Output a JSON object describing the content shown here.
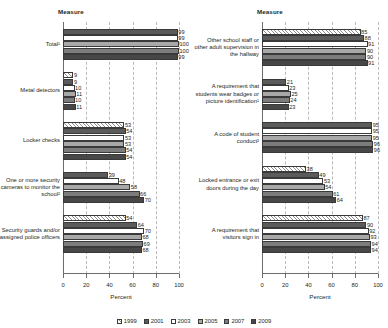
{
  "chart_data": {
    "type": "bar",
    "orientation": "horizontal",
    "title": "",
    "xlabel": "Percent",
    "ylabel": "Measure",
    "xlim": [
      0,
      100
    ],
    "xticks": [
      0,
      20,
      40,
      60,
      80,
      100
    ],
    "grid": true,
    "legend_position": "bottom",
    "series_names": [
      "1999",
      "2001",
      "2003",
      "2005",
      "2007",
      "2009"
    ],
    "panels": [
      {
        "name": "left",
        "axis_header": "Measure",
        "xlabel": "Percent",
        "groups": [
          {
            "category": "Total¹",
            "series": [
              "2001",
              "2003",
              "2005",
              "2007",
              "2009"
            ],
            "values": [
              99,
              99,
              100,
              100,
              99
            ]
          },
          {
            "category": "Metal detectors",
            "series": [
              "1999",
              "2001",
              "2003",
              "2005",
              "2007",
              "2009"
            ],
            "values": [
              9,
              9,
              10,
              11,
              10,
              11
            ]
          },
          {
            "category": "Locker checks",
            "series": [
              "1999",
              "2001",
              "2003",
              "2005",
              "2007",
              "2009"
            ],
            "values": [
              53,
              54,
              53,
              53,
              54,
              54
            ]
          },
          {
            "category": "One or more security cameras to monitor the school²",
            "series": [
              "2001",
              "2003",
              "2005",
              "2007",
              "2009"
            ],
            "values": [
              39,
              48,
              58,
              66,
              70
            ]
          },
          {
            "category": "Security guards and/or assigned police officers",
            "series": [
              "1999",
              "2001",
              "2003",
              "2005",
              "2007",
              "2009"
            ],
            "values": [
              54,
              64,
              70,
              68,
              69,
              68
            ]
          }
        ]
      },
      {
        "name": "right",
        "axis_header": "Measure",
        "xlabel": "Percent",
        "groups": [
          {
            "category": "Other school staff or other adult supervision in the hallway",
            "series": [
              "1999",
              "2001",
              "2003",
              "2005",
              "2007",
              "2009"
            ],
            "values": [
              85,
              88,
              91,
              90,
              90,
              91
            ]
          },
          {
            "category": "A requirement that students wear badges or picture identification¹",
            "series": [
              "2001",
              "2003",
              "2005",
              "2007",
              "2009"
            ],
            "values": [
              21,
              23,
              25,
              24,
              23
            ]
          },
          {
            "category": "A code of student conduct²",
            "series": [
              "2001",
              "2003",
              "2005",
              "2007",
              "2009"
            ],
            "values": [
              95,
              95,
              95,
              96,
              96
            ]
          },
          {
            "category": "Locked entrance or exit doors during the day",
            "series": [
              "1999",
              "2001",
              "2003",
              "2005",
              "2007",
              "2009"
            ],
            "values": [
              38,
              49,
              53,
              54,
              61,
              64
            ]
          },
          {
            "category": "A requirement that visitors sign in",
            "series": [
              "1999",
              "2001",
              "2003",
              "2005",
              "2007",
              "2009"
            ],
            "values": [
              87,
              90,
              92,
              93,
              94,
              94
            ]
          }
        ]
      }
    ],
    "legend": [
      {
        "label": "1999",
        "swatch": "white-hatched"
      },
      {
        "label": "2001",
        "swatch": "dark-gray"
      },
      {
        "label": "2003",
        "swatch": "white"
      },
      {
        "label": "2005",
        "swatch": "light-gray"
      },
      {
        "label": "2007",
        "swatch": "medium-gray"
      },
      {
        "label": "2009",
        "swatch": "darkest-gray"
      }
    ]
  },
  "colors": {
    "s1999": "#ffffff",
    "s2001": "#5b5b5b",
    "s2003": "#ffffff",
    "s2005": "#a8a8a8",
    "s2007": "#7c7c7c",
    "s2009": "#474747",
    "grid": "#b9b9b9",
    "axis": "#6d6d6d",
    "text": "#231f20"
  }
}
